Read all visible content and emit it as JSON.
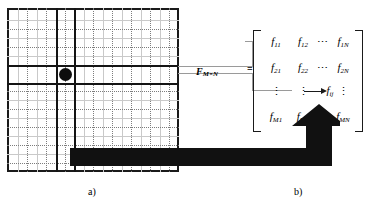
{
  "figure": {
    "panel_a": {
      "label": "a)",
      "grid": {
        "columns": 9,
        "rows": 9,
        "selected_column_index": 3,
        "selected_row_index": 4,
        "marker": "selected-pixel-dot"
      }
    },
    "panel_b": {
      "label": "b)",
      "matrix_label": "F",
      "matrix_label_sub": "M×N",
      "equals": "=",
      "rows": [
        [
          "f",
          "f",
          "⋯",
          "f"
        ],
        [
          "f",
          "f",
          "⋯",
          "f"
        ],
        [
          "⋮",
          "⋮",
          "",
          "⋮"
        ],
        [
          "f",
          "f",
          "⋯",
          "f"
        ]
      ],
      "cells": {
        "r1": [
          {
            "base": "f",
            "sub": "11"
          },
          {
            "base": "f",
            "sub": "12"
          },
          {
            "dots": "⋯"
          },
          {
            "base": "f",
            "sub": "1N"
          }
        ],
        "r2": [
          {
            "base": "f",
            "sub": "21"
          },
          {
            "base": "f",
            "sub": "22"
          },
          {
            "dots": "⋯"
          },
          {
            "base": "f",
            "sub": "2N"
          }
        ],
        "r3": [
          {
            "vdots": "⋮"
          },
          {
            "vdots": "⋮"
          },
          {
            "base": "f",
            "sub": "ij"
          },
          {
            "vdots": "⋮"
          }
        ],
        "r4": [
          {
            "base": "f",
            "sub": "M1"
          },
          {
            "base": "f",
            "sub": "M2"
          },
          {
            "dots": "⋯"
          },
          {
            "base": "f",
            "sub": "MN"
          }
        ]
      },
      "pointer_target": "f_ij"
    },
    "connector_arrow": "thick-L-shaped-arrow",
    "colors": {
      "ink": "#1a1a1a",
      "grid_dotted": "#7d7d7d",
      "grid_faint": "#c9c9c9",
      "leader": "#9a9a9a",
      "background": "#ffffff"
    }
  }
}
